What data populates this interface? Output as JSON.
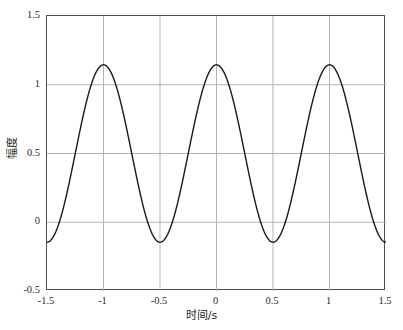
{
  "chart_data": {
    "type": "line",
    "title": "",
    "xlabel": "时间/s",
    "ylabel": "幅度",
    "xlim": [
      -1.5,
      1.5
    ],
    "ylim": [
      -0.5,
      1.5
    ],
    "xticks": [
      -1.5,
      -1,
      -0.5,
      0,
      0.5,
      1,
      1.5
    ],
    "xtick_labels": [
      "-1.5",
      "-1",
      "-0.5",
      "0",
      "0.5",
      "1",
      "1.5"
    ],
    "yticks": [
      -0.5,
      0,
      0.5,
      1,
      1.5
    ],
    "ytick_labels": [
      "-0.5",
      "0",
      "0.5",
      "1",
      "1.5"
    ],
    "grid": true,
    "legend": null,
    "series": [
      {
        "name": "cosine",
        "color": "#1a1a1a",
        "line_width": 1.4,
        "offset": 0.5,
        "amplitude": 0.645,
        "frequency_hz": 1.0,
        "phase_deg": 0,
        "description": "y = 0.5 + 0.645*cos(2*pi*t)",
        "x": [
          -1.5,
          -1.45,
          -1.4,
          -1.35,
          -1.3,
          -1.25,
          -1.2,
          -1.15,
          -1.1,
          -1.05,
          -1.0,
          -0.95,
          -0.9,
          -0.85,
          -0.8,
          -0.75,
          -0.7,
          -0.65,
          -0.6,
          -0.55,
          -0.5,
          -0.45,
          -0.4,
          -0.35,
          -0.3,
          -0.25,
          -0.2,
          -0.15,
          -0.1,
          -0.05,
          0.0,
          0.05,
          0.1,
          0.15,
          0.2,
          0.25,
          0.3,
          0.35,
          0.4,
          0.45,
          0.5,
          0.55,
          0.6,
          0.65,
          0.7,
          0.75,
          0.8,
          0.85,
          0.9,
          0.95,
          1.0,
          1.05,
          1.1,
          1.15,
          1.2,
          1.25,
          1.3,
          1.35,
          1.4,
          1.45,
          1.5
        ],
        "y": [
          -0.145,
          -0.129,
          -0.081,
          -0.005,
          0.096,
          0.5,
          0.904,
          1.005,
          1.081,
          1.129,
          1.145,
          1.129,
          1.081,
          1.005,
          0.904,
          0.5,
          0.096,
          -0.005,
          -0.081,
          -0.129,
          -0.145,
          -0.129,
          -0.081,
          -0.005,
          0.096,
          0.5,
          0.904,
          1.005,
          1.081,
          1.129,
          1.145,
          1.129,
          1.081,
          1.005,
          0.904,
          0.5,
          0.096,
          -0.005,
          -0.081,
          -0.129,
          -0.145,
          -0.129,
          -0.081,
          -0.005,
          0.096,
          0.5,
          0.904,
          1.005,
          1.081,
          1.129,
          1.145,
          1.129,
          1.081,
          1.005,
          0.904,
          0.5,
          0.096,
          -0.005,
          -0.081,
          -0.129,
          -0.145
        ],
        "peaks": [
          {
            "x": -1,
            "y": 1.145
          },
          {
            "x": 0,
            "y": 1.145
          },
          {
            "x": 1,
            "y": 1.145
          }
        ],
        "troughs": [
          {
            "x": -1.5,
            "y": -0.145
          },
          {
            "x": -0.5,
            "y": -0.145
          },
          {
            "x": 0.5,
            "y": -0.145
          },
          {
            "x": 1.5,
            "y": -0.145
          }
        ]
      }
    ],
    "colors": {
      "line": "#1a1a1a",
      "grid": "#b3b3b3",
      "axis": "#4d4d4d",
      "text": "#1c1c1c",
      "background": "#ffffff"
    }
  }
}
